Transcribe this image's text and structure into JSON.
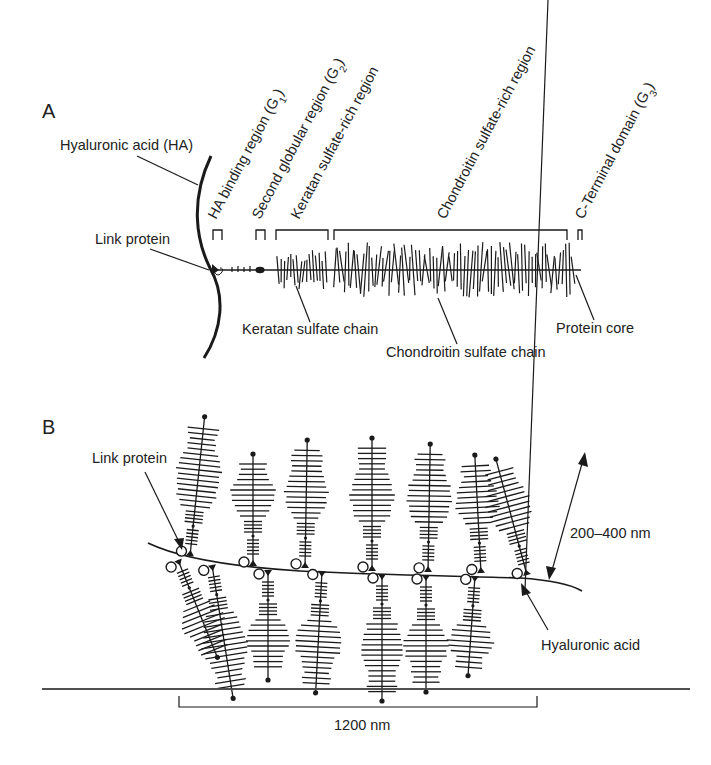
{
  "figure": {
    "panel_a": {
      "letter": "A",
      "labels": {
        "hyaluronic_acid": "Hyaluronic acid (HA)",
        "link_protein": "Link protein",
        "keratan_chain": "Keratan sulfate chain",
        "chondroitin_chain": "Chondroitin sulfate chain",
        "protein_core": "Protein core"
      },
      "regions": [
        {
          "text": "HA binding region (G",
          "sub": "1",
          "tail": ")",
          "x": 216,
          "bracket": [
            213,
            222
          ]
        },
        {
          "text": "Second globular region (G",
          "sub": "2",
          "tail": ")",
          "x": 260,
          "bracket": [
            256,
            265
          ]
        },
        {
          "text": "Keratan sulfate-rich region",
          "sub": "",
          "tail": "",
          "x": 299,
          "bracket": [
            276,
            328
          ]
        },
        {
          "text": "Chondroitin sulfate-rich region",
          "sub": "",
          "tail": "",
          "x": 445,
          "bracket": [
            334,
            567
          ]
        },
        {
          "text": "C-Terminal domain (G",
          "sub": "3",
          "tail": ")",
          "x": 583,
          "bracket": [
            578,
            582
          ]
        }
      ]
    },
    "panel_b": {
      "letter": "B",
      "labels": {
        "link_protein": "Link protein",
        "hyaluronic_acid": "Hyaluronic acid",
        "length_range": "200–400 nm",
        "span": "1200 nm"
      }
    }
  },
  "colors": {
    "ink": "#1a1a1a",
    "background": "#ffffff",
    "rule": "#444444"
  }
}
